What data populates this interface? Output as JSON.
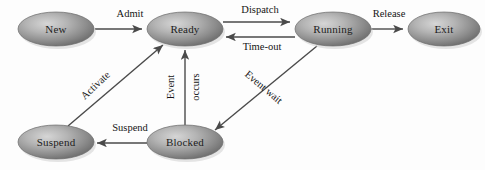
{
  "diagram": {
    "type": "state-diagram",
    "background_color": "#fdfdfd",
    "node_fill_center": "#bdbdbd",
    "node_fill_edge": "#6e6e6e",
    "node_stroke": "#6b6b6b",
    "edge_color": "#4a4a4a",
    "text_color": "#1c1c1c",
    "nodes": [
      {
        "id": "new",
        "label": "New",
        "cx": 56,
        "cy": 29,
        "rx": 38,
        "ry": 17
      },
      {
        "id": "ready",
        "label": "Ready",
        "cx": 185,
        "cy": 29,
        "rx": 38,
        "ry": 17
      },
      {
        "id": "running",
        "label": "Running",
        "cx": 333,
        "cy": 29,
        "rx": 38,
        "ry": 17
      },
      {
        "id": "exit",
        "label": "Exit",
        "cx": 444,
        "cy": 29,
        "rx": 36,
        "ry": 17
      },
      {
        "id": "suspend",
        "label": "Suspend",
        "cx": 56,
        "cy": 142,
        "rx": 38,
        "ry": 17
      },
      {
        "id": "blocked",
        "label": "Blocked",
        "cx": 185,
        "cy": 142,
        "rx": 38,
        "ry": 17
      }
    ],
    "edges": [
      {
        "id": "admit",
        "label": "Admit",
        "from": "new",
        "to": "ready",
        "label_x": 130,
        "label_y": 15,
        "rotation": 0
      },
      {
        "id": "dispatch",
        "label": "Dispatch",
        "from": "ready",
        "to": "running",
        "label_x": 260,
        "label_y": 11,
        "rotation": 0
      },
      {
        "id": "timeout",
        "label": "Time-out",
        "from": "running",
        "to": "ready",
        "label_x": 262,
        "label_y": 48,
        "rotation": 0
      },
      {
        "id": "release",
        "label": "Release",
        "from": "running",
        "to": "exit",
        "label_x": 389,
        "label_y": 15,
        "rotation": 0
      },
      {
        "id": "activate",
        "label": "Activate",
        "from": "suspend",
        "to": "ready",
        "label_x": 96,
        "label_y": 86,
        "rotation": -43
      },
      {
        "id": "event-occurs-1",
        "label": "Event",
        "from": "blocked",
        "to": "ready",
        "label_x": 172,
        "label_y": 87,
        "rotation": -90
      },
      {
        "id": "event-occurs-2",
        "label": "occurs",
        "from": "blocked",
        "to": "ready",
        "label_x": 197,
        "label_y": 87,
        "rotation": -90
      },
      {
        "id": "event-wait",
        "label": "Event wait",
        "from": "running",
        "to": "blocked",
        "label_x": 263,
        "label_y": 88,
        "rotation": 43
      },
      {
        "id": "suspend-edge",
        "label": "Suspend",
        "from": "blocked",
        "to": "suspend",
        "label_x": 130,
        "label_y": 129,
        "rotation": 0
      }
    ]
  }
}
